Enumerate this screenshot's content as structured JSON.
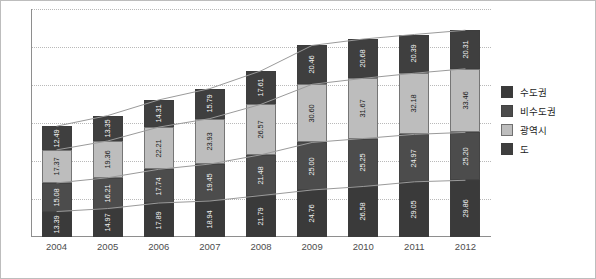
{
  "chart_data": {
    "type": "bar",
    "stacked": true,
    "title": "",
    "subtitle": "",
    "xlabel": "",
    "ylabel": "",
    "grid": true,
    "legend_position": "right",
    "ylim": [
      0,
      120
    ],
    "categories": [
      "2004",
      "2005",
      "2006",
      "2007",
      "2008",
      "2009",
      "2010",
      "2011",
      "2012"
    ],
    "series": [
      {
        "name": "수도권",
        "color": "#3a3a3a",
        "values": [
          13.39,
          14.97,
          17.89,
          18.94,
          21.79,
          24.76,
          26.58,
          29.05,
          29.86
        ]
      },
      {
        "name": "비수도권",
        "color": "#4c4c4c",
        "values": [
          15.08,
          16.21,
          17.74,
          19.45,
          21.48,
          25.0,
          25.25,
          24.97,
          25.2
        ]
      },
      {
        "name": "광역시",
        "color": "#bdbdbd",
        "values": [
          17.37,
          19.36,
          22.21,
          23.93,
          26.57,
          30.6,
          31.67,
          32.18,
          33.46
        ]
      },
      {
        "name": "도",
        "color": "#3f3f3f",
        "values": [
          12.49,
          13.35,
          14.31,
          15.79,
          17.61,
          20.46,
          20.68,
          20.39,
          20.31
        ]
      }
    ],
    "trend_lines": [
      {
        "name": "수도권-line",
        "values": [
          13.39,
          14.97,
          17.89,
          18.94,
          21.79,
          24.76,
          26.58,
          29.05,
          29.86
        ]
      },
      {
        "name": "비수도권-line",
        "values": [
          28.47,
          31.18,
          35.63,
          38.39,
          43.27,
          49.76,
          51.83,
          54.02,
          55.06
        ]
      },
      {
        "name": "광역시-line",
        "values": [
          45.84,
          50.54,
          57.84,
          62.32,
          69.84,
          80.36,
          83.5,
          86.2,
          88.52
        ]
      },
      {
        "name": "도-line",
        "values": [
          58.33,
          63.89,
          72.15,
          78.11,
          87.45,
          100.82,
          104.18,
          106.59,
          108.83
        ]
      }
    ],
    "gridline_values": [
      20,
      40,
      60,
      80,
      100,
      120
    ]
  },
  "legend": {
    "items": [
      {
        "label": "수도권",
        "color": "#3a3a3a"
      },
      {
        "label": "비수도권",
        "color": "#4c4c4c"
      },
      {
        "label": "광역시",
        "color": "#bdbdbd"
      },
      {
        "label": "도",
        "color": "#3f3f3f"
      }
    ]
  }
}
